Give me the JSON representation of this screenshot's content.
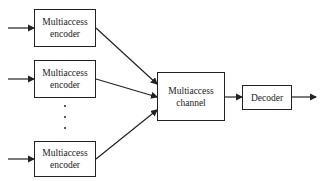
{
  "diagram": {
    "encoders": [
      {
        "line1": "Multiaccess",
        "line2": "encoder"
      },
      {
        "line1": "Multiaccess",
        "line2": "encoder"
      },
      {
        "line1": "Multiaccess",
        "line2": "encoder"
      }
    ],
    "ellipsis": "⋮",
    "channel": {
      "line1": "Multiaccess",
      "line2": "channel"
    },
    "decoder": {
      "label": "Decoder"
    }
  },
  "colors": {
    "stroke": "#222222",
    "background": "#ffffff"
  }
}
